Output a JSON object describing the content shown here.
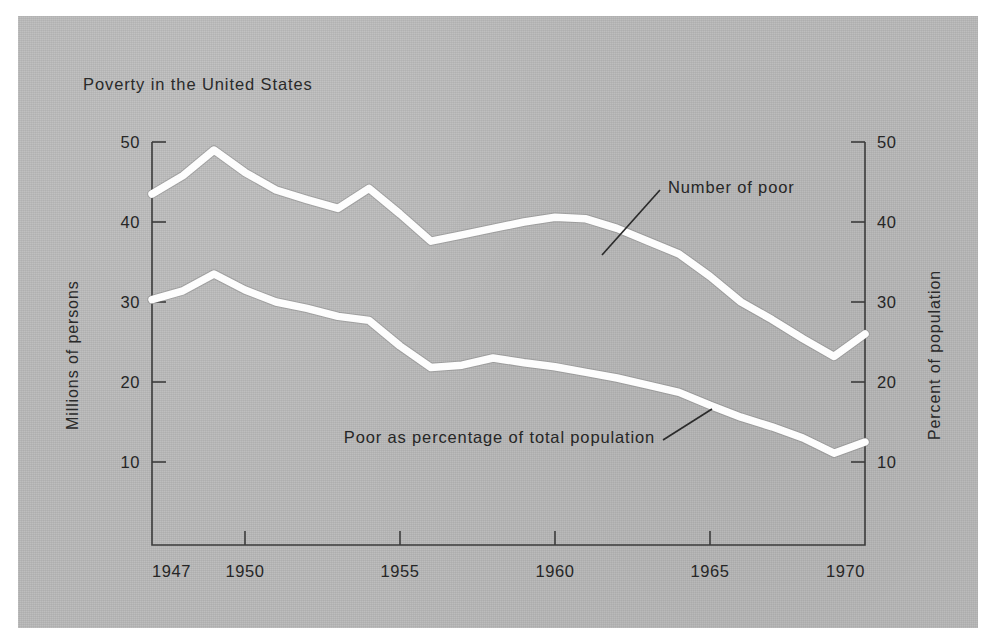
{
  "figure": {
    "title": "Poverty in the United States",
    "background_color": "#b9b9b9",
    "line_color": "#fdfdfd",
    "axis_color": "#3b3b3b"
  },
  "chart_data": {
    "type": "line",
    "title": "Poverty in the United States",
    "xlabel": "",
    "ylabel": "Millions of persons",
    "y2label": "Percent of population",
    "xlim": [
      1947,
      1970
    ],
    "ylim": [
      0,
      50
    ],
    "y2lim": [
      0,
      50
    ],
    "grid": false,
    "legend": "annotations-on-plot",
    "xticks": [
      1947,
      1950,
      1955,
      1960,
      1965,
      1970
    ],
    "xticklabels": [
      "1947",
      "1950",
      "1955",
      "1960",
      "1965",
      "1970"
    ],
    "yticks": [
      10,
      20,
      30,
      40,
      50
    ],
    "yticklabels": [
      "10",
      "20",
      "30",
      "40",
      "50"
    ],
    "y2ticks": [
      10,
      20,
      30,
      40,
      50
    ],
    "y2ticklabels": [
      "10",
      "20",
      "30",
      "40",
      "50"
    ],
    "x": [
      1947,
      1948,
      1949,
      1950,
      1951,
      1952,
      1953,
      1954,
      1955,
      1956,
      1957,
      1958,
      1959,
      1960,
      1961,
      1962,
      1963,
      1964,
      1965,
      1966,
      1967,
      1968,
      1969,
      1970
    ],
    "series": [
      {
        "name": "Number of poor",
        "axis": "left",
        "units": "millions of persons",
        "values": [
          43.5,
          45.8,
          49.0,
          46.2,
          44.0,
          42.8,
          41.7,
          44.2,
          41.0,
          37.6,
          38.4,
          39.2,
          40.0,
          40.6,
          40.4,
          39.2,
          37.6,
          36.0,
          33.2,
          30.0,
          27.8,
          25.4,
          23.2,
          26.0
        ]
      },
      {
        "name": "Poor as percentage of total population",
        "axis": "right",
        "units": "percent of population",
        "values": [
          30.3,
          31.4,
          33.5,
          31.5,
          30.0,
          29.2,
          28.2,
          27.7,
          24.5,
          21.8,
          22.1,
          23.0,
          22.4,
          21.9,
          21.2,
          20.5,
          19.6,
          18.7,
          17.1,
          15.6,
          14.4,
          13.0,
          11.1,
          12.5
        ]
      }
    ],
    "annotations": [
      {
        "text": "Number of poor",
        "points_to_series": "Number of poor",
        "points_to_x": 1961.0
      },
      {
        "text": "Poor as percentage of total population",
        "points_to_series": "Poor as percentage of total population",
        "points_to_x": 1964.5
      }
    ]
  }
}
